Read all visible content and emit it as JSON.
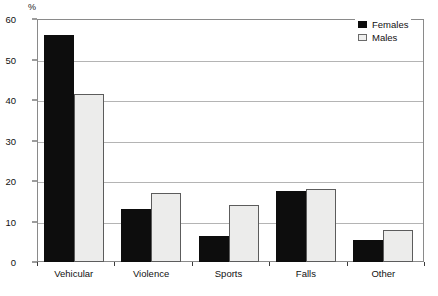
{
  "chart_data": {
    "type": "bar",
    "title": "",
    "subtitle": "",
    "xlabel": "",
    "ylabel": "%",
    "unit_label": "%",
    "categories": [
      "Vehicular",
      "Violence",
      "Sports",
      "Falls",
      "Other"
    ],
    "series": [
      {
        "name": "Females",
        "color": "#0d0d0d",
        "values": [
          56,
          13,
          6.5,
          17.5,
          5.5
        ]
      },
      {
        "name": "Males",
        "color": "#ececeb",
        "values": [
          41.5,
          17,
          14,
          18,
          8
        ]
      }
    ],
    "ylim": [
      0,
      60
    ],
    "yticks": [
      0,
      10,
      20,
      30,
      40,
      50,
      60
    ],
    "ytick_labels": [
      "0",
      "10",
      "20",
      "30",
      "40",
      "50",
      "60"
    ],
    "grid": true,
    "grid_axis": "y",
    "legend_position": "top-right",
    "legend_entries": [
      "Females",
      "Males"
    ]
  },
  "legend": {
    "items": [
      {
        "label": "Females",
        "swatch": "legend-swatch-females"
      },
      {
        "label": "Males",
        "swatch": "legend-swatch-males"
      }
    ]
  }
}
